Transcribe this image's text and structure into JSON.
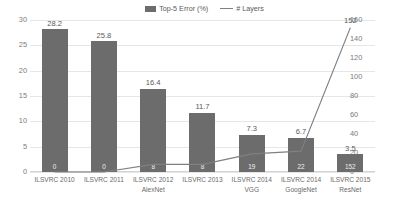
{
  "chart_data": {
    "type": "bar",
    "title": "",
    "subtitle": "",
    "xlabel": "",
    "ylabel": "",
    "grid": true,
    "legend_position": "top-center",
    "categories": [
      "ILSVRC 2010",
      "ILSVRC 2011",
      "ILSVRC 2012 AlexNet",
      "ILSVRC 2013",
      "ILSVRC 2014 VGG",
      "ILSVRC 2014 GoogleNet",
      "ILSVRC 2015 ResNet"
    ],
    "category_lines": [
      [
        "ILSVRC 2010",
        ""
      ],
      [
        "ILSVRC 2011",
        ""
      ],
      [
        "ILSVRC 2012",
        "AlexNet"
      ],
      [
        "ILSVRC 2013",
        ""
      ],
      [
        "ILSVRC 2014",
        "VGG"
      ],
      [
        "ILSVRC 2014",
        "GoogleNet"
      ],
      [
        "ILSVRC 2015",
        "ResNet"
      ]
    ],
    "series": [
      {
        "name": "Top-5 Error (%)",
        "type": "bar",
        "axis": "left",
        "color": "#6c6c6c",
        "values": [
          28.2,
          25.8,
          16.4,
          11.7,
          7.3,
          6.7,
          3.5
        ],
        "labels": [
          "28.2",
          "25.8",
          "16.4",
          "11.7",
          "7.3",
          "6.7",
          "3.5"
        ]
      },
      {
        "name": "# Layers",
        "type": "line",
        "axis": "right",
        "color": "#808080",
        "values": [
          0,
          0,
          8,
          8,
          19,
          22,
          152
        ],
        "labels": [
          "0",
          "0",
          "8",
          "8",
          "19",
          "22",
          "152"
        ],
        "visible_point_labels": {
          "6": "152"
        }
      }
    ],
    "left_axis": {
      "label": "",
      "min": 0,
      "max": 30,
      "step": 5,
      "ticks": [
        "0",
        "5",
        "10",
        "15",
        "20",
        "25",
        "30"
      ]
    },
    "right_axis": {
      "label": "",
      "min": 0,
      "max": 160,
      "step": 20,
      "ticks": [
        "0",
        "20",
        "40",
        "60",
        "80",
        "100",
        "120",
        "140",
        "160"
      ]
    }
  },
  "legend": {
    "items": [
      {
        "label": "Top-5 Error (%)",
        "marker": "bar-swatch",
        "color": "#6c6c6c"
      },
      {
        "label": "# Layers",
        "marker": "line-swatch",
        "color": "#808080"
      }
    ]
  },
  "colors": {
    "bar": "#6c6c6c",
    "line": "#808080",
    "grid": "#e6e6e6",
    "axis_text": "#7a7a7a",
    "value_text": "#5a5a5a",
    "background": "#ffffff"
  }
}
